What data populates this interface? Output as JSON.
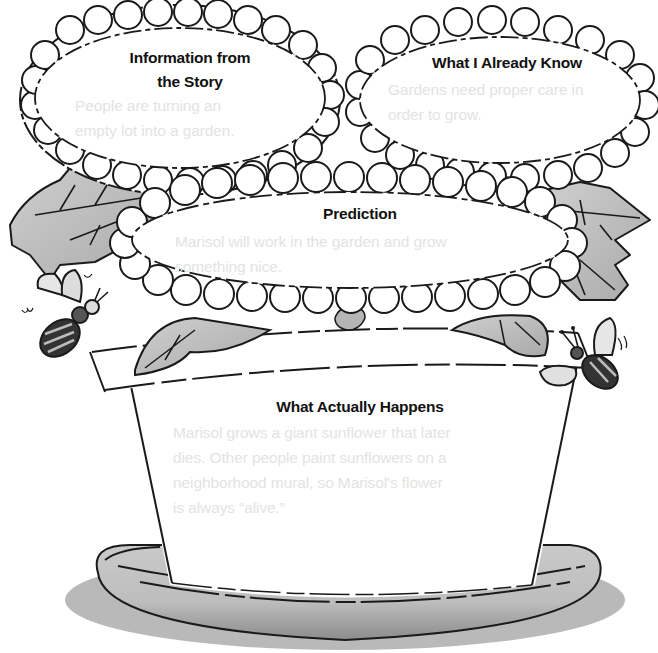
{
  "organizer": {
    "title": "Prediction Flower Pot Graphic Organizer",
    "colors": {
      "outline": "#1a1a1a",
      "leaf_fill": "#c4c4c4",
      "pot_saucer_fill": "#bdbdbd",
      "heading_text": "#111111",
      "answer_text": "#e3e3e3"
    },
    "sections": {
      "story_info": {
        "heading_line1": "Information from",
        "heading_line2": "the Story",
        "answer_line1": "People are turning an",
        "answer_line2": "empty lot into a garden."
      },
      "already_know": {
        "heading": "What I Already Know",
        "answer_line1": "Gardens need proper care in",
        "answer_line2": "order to grow."
      },
      "prediction": {
        "heading": "Prediction",
        "answer_line1": "Marisol will work in the garden and grow",
        "answer_line2": "something nice."
      },
      "actually_happens": {
        "heading": "What Actually Happens",
        "answer_line1": "Marisol grows a giant sunflower that later",
        "answer_line2": "dies. Other people paint sunflowers on a",
        "answer_line3": "neighborhood mural, so Marisol's flower",
        "answer_line4": "is always “alive.”"
      }
    },
    "decorations": [
      "leaf-icon",
      "bee-icon",
      "flower-pot-icon",
      "saucer-icon"
    ]
  }
}
